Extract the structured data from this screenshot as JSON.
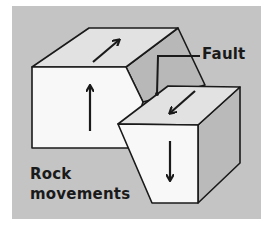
{
  "diagram": {
    "colors": {
      "background_panel": "#c4c4c4",
      "page_background": "#ffffff",
      "front_face": "#f8f8f8",
      "top_face": "#e2e2e2",
      "side_face": "#bababa",
      "fault_plane": "#b8b8b8",
      "stroke": "#1a1a1a"
    },
    "labels": {
      "fault": "Fault",
      "rock_line1": "Rock",
      "rock_line2": "movements"
    },
    "blocks": [
      {
        "name": "upthrown-block",
        "position": "left",
        "arrows": [
          {
            "face": "top",
            "direction": "up-right (back)"
          },
          {
            "face": "front",
            "direction": "up"
          }
        ]
      },
      {
        "name": "downthrown-block",
        "position": "right",
        "arrows": [
          {
            "face": "top",
            "direction": "down-left (forward)"
          },
          {
            "face": "front",
            "direction": "down"
          }
        ]
      }
    ],
    "annotations": [
      {
        "text": "Fault",
        "points_to": "fault plane between blocks"
      },
      {
        "text": "Rock movements",
        "position": "lower-left"
      }
    ]
  }
}
